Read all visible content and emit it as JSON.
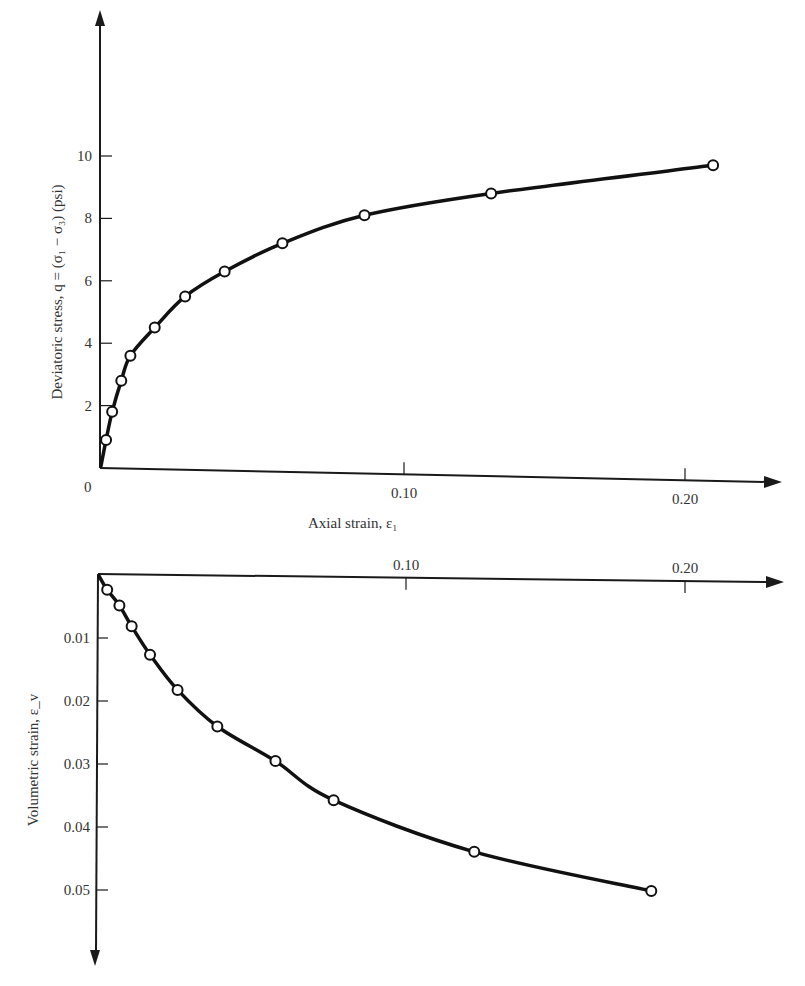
{
  "chart_data": [
    {
      "type": "line",
      "title": "",
      "xlabel": "Axial strain, ε₁",
      "ylabel": "Deviatoric stress, q = (σ₁ − σ₃) (psi)",
      "xlim": [
        0,
        0.23
      ],
      "ylim": [
        0,
        14
      ],
      "x_ticks": [
        0.1,
        0.2
      ],
      "x_tick_labels": [
        "0.10",
        "0.20"
      ],
      "y_ticks": [
        2,
        4,
        6,
        8,
        10
      ],
      "y_tick_labels": [
        "2",
        "4",
        "6",
        "8",
        "10"
      ],
      "origin_label": "0",
      "grid": false,
      "legend": null,
      "series": [
        {
          "name": "Deviatoric stress vs axial strain",
          "marker": "open-circle",
          "x": [
            0.002,
            0.004,
            0.007,
            0.01,
            0.018,
            0.028,
            0.041,
            0.06,
            0.087,
            0.131,
            0.21
          ],
          "y": [
            0.9,
            1.8,
            2.8,
            3.6,
            4.5,
            5.5,
            6.3,
            7.2,
            8.1,
            8.8,
            9.7
          ]
        }
      ]
    },
    {
      "type": "line",
      "title": "",
      "xlabel": "",
      "ylabel": "Volumetric strain, ε_v",
      "xlim": [
        0,
        0.23
      ],
      "ylim": [
        0,
        0.058
      ],
      "y_inverted": true,
      "x_axis_position": "top",
      "x_ticks": [
        0.1,
        0.2
      ],
      "x_tick_labels": [
        "0.10",
        "0.20"
      ],
      "y_ticks": [
        0.01,
        0.02,
        0.03,
        0.04,
        0.05
      ],
      "y_tick_labels": [
        "0.01",
        "0.02",
        "0.03",
        "0.04",
        "0.05"
      ],
      "grid": false,
      "legend": null,
      "series": [
        {
          "name": "Volumetric strain vs axial strain",
          "marker": "open-circle",
          "x": [
            0.003,
            0.007,
            0.011,
            0.017,
            0.026,
            0.039,
            0.058,
            0.077,
            0.125,
            0.188
          ],
          "y": [
            0.0025,
            0.005,
            0.0083,
            0.0128,
            0.0184,
            0.0242,
            0.0297,
            0.0359,
            0.0441,
            0.0503
          ]
        }
      ]
    }
  ]
}
